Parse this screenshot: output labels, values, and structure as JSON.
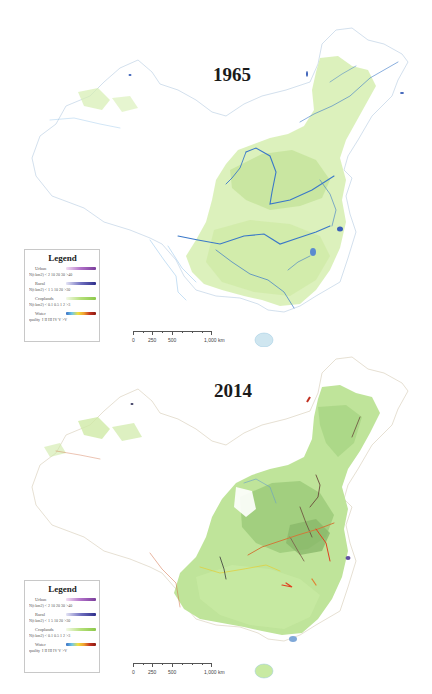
{
  "figure": {
    "panels": [
      {
        "year": "1965",
        "legend": {
          "title": "Legend",
          "sections": [
            {
              "name": "Urban",
              "unit_ticks": "N(t km2) < 2  10  20 30  >40",
              "color_ramp": [
                "#f3dff3",
                "#b070c8",
                "#7a3d9a"
              ]
            },
            {
              "name": "Rural",
              "unit_ticks": "N(t km2) < 1  5  10  20  >30",
              "color_ramp": [
                "#e5e5f5",
                "#7070c0",
                "#2d2d8a"
              ]
            },
            {
              "name": "Croplands",
              "unit_ticks": "N(t km2) < 0.1  0.5  1  2  >3",
              "color_ramp": [
                "#f4f9e8",
                "#b5e07a",
                "#8cc84a"
              ]
            },
            {
              "name": "Water quality",
              "name_line1": "Water",
              "name_line2": "quality",
              "unit_ticks": "I  II III IV V  >V",
              "color_ramp": [
                "#3a6fc4",
                "#6fc8e8",
                "#f0e040",
                "#f0a030",
                "#c03020",
                "#8a1a10"
              ]
            }
          ]
        },
        "scalebar": {
          "labels": [
            "0",
            "250",
            "500",
            "1,000 km"
          ]
        }
      },
      {
        "year": "2014",
        "legend": {
          "title": "Legend",
          "sections": [
            {
              "name": "Urban",
              "unit_ticks": "N(t km2) < 2  10  20 30  >40"
            },
            {
              "name": "Rural",
              "unit_ticks": "N(t km2) < 1  5  10  20  >30"
            },
            {
              "name": "Croplands",
              "unit_ticks": "N(t km2) < 0.1  0.5  1  2  >3"
            },
            {
              "name": "Water quality",
              "name_line1": "Water",
              "name_line2": "quality",
              "unit_ticks": "I  II III IV V  >V"
            }
          ]
        },
        "scalebar": {
          "labels": [
            "0",
            "250",
            "500",
            "1,000 km"
          ]
        }
      }
    ],
    "colors": {
      "cropland_light": "#dff0c0",
      "cropland": "#b9e08a",
      "cropland_dark": "#8fbf6a",
      "river_1965": "#3a78c8",
      "river_polluted": "#d05030",
      "border": "#c8d8e8"
    }
  }
}
